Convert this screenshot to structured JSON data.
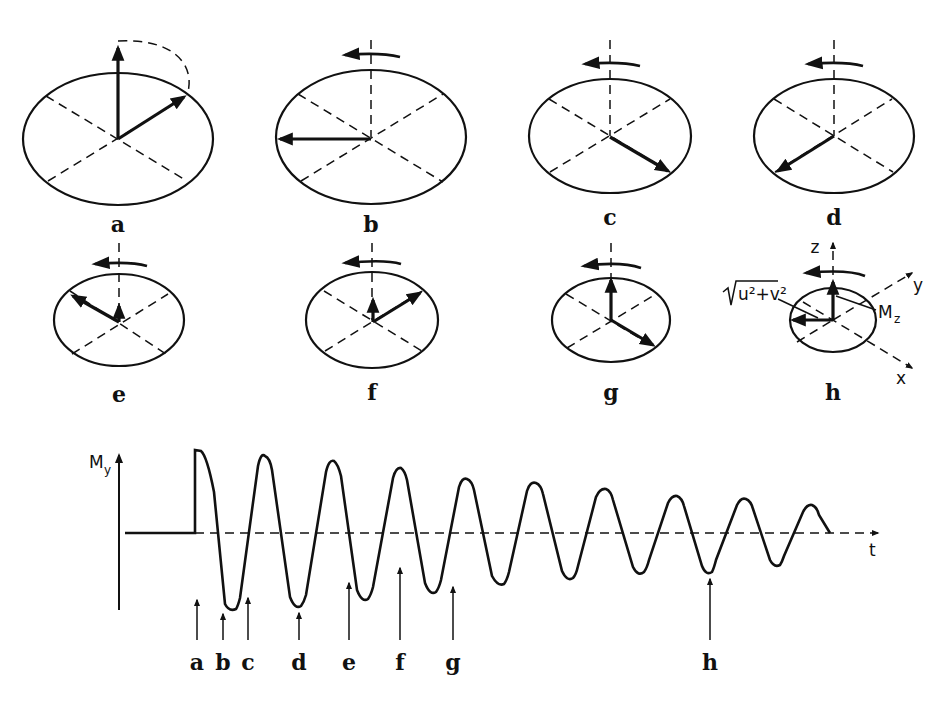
{
  "figure": {
    "panels": [
      {
        "id": "a",
        "label": "a"
      },
      {
        "id": "b",
        "label": "b"
      },
      {
        "id": "c",
        "label": "c"
      },
      {
        "id": "d",
        "label": "d"
      },
      {
        "id": "e",
        "label": "e"
      },
      {
        "id": "f",
        "label": "f"
      },
      {
        "id": "g",
        "label": "g"
      },
      {
        "id": "h",
        "label": "h"
      }
    ],
    "panel_h": {
      "axis_z": "z",
      "axis_y": "y",
      "axis_x": "x",
      "transverse_label": "√u²+v²",
      "transverse_radicand": "u²+v²",
      "longitudinal_label": "M",
      "longitudinal_sub": "z"
    },
    "signal_plot": {
      "y_axis_label": "M",
      "y_axis_sub": "y",
      "x_axis_label": "t",
      "markers": [
        "a",
        "b",
        "c",
        "d",
        "e",
        "f",
        "g",
        "h"
      ]
    }
  }
}
